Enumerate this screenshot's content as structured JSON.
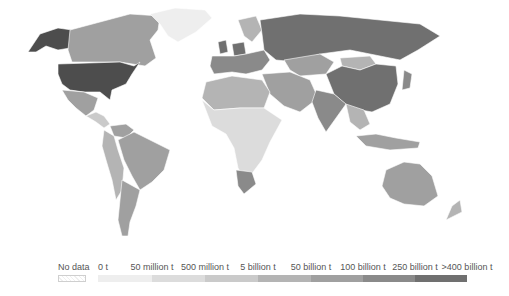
{
  "map": {
    "projection": "world-robinson-like",
    "colors": {
      "no_data": "#f4f4f4",
      "bin_0": "#eeeeee",
      "bin_1": "#dcdcdc",
      "bin_2": "#cacaca",
      "bin_3": "#b4b4b4",
      "bin_4": "#a0a0a0",
      "bin_5": "#8a8a8a",
      "bin_6": "#707070",
      "bin_7": "#4d4d4d"
    },
    "regions": [
      {
        "name": "United States",
        "bin": 7
      },
      {
        "name": "Alaska",
        "bin": 7
      },
      {
        "name": "Canada",
        "bin": 4
      },
      {
        "name": "Greenland",
        "bin": 0
      },
      {
        "name": "Mexico",
        "bin": 4
      },
      {
        "name": "Central America",
        "bin": 2
      },
      {
        "name": "Brazil",
        "bin": 4
      },
      {
        "name": "Argentina",
        "bin": 4
      },
      {
        "name": "Venezuela",
        "bin": 4
      },
      {
        "name": "Western South America",
        "bin": 3
      },
      {
        "name": "Europe West",
        "bin": 5
      },
      {
        "name": "United Kingdom",
        "bin": 6
      },
      {
        "name": "Germany",
        "bin": 6
      },
      {
        "name": "Scandinavia",
        "bin": 3
      },
      {
        "name": "Russia",
        "bin": 6
      },
      {
        "name": "Kazakhstan",
        "bin": 4
      },
      {
        "name": "China",
        "bin": 6
      },
      {
        "name": "Mongolia",
        "bin": 3
      },
      {
        "name": "India",
        "bin": 5
      },
      {
        "name": "Middle East",
        "bin": 4
      },
      {
        "name": "Japan",
        "bin": 5
      },
      {
        "name": "Southeast Asia",
        "bin": 3
      },
      {
        "name": "Indonesia",
        "bin": 4
      },
      {
        "name": "Australia",
        "bin": 4
      },
      {
        "name": "New Zealand",
        "bin": 3
      },
      {
        "name": "North Africa",
        "bin": 3
      },
      {
        "name": "Sub-Saharan Africa",
        "bin": 1
      },
      {
        "name": "South Africa",
        "bin": 5
      }
    ]
  },
  "legend": {
    "items": [
      {
        "label": "No data",
        "color": "#f4f4f4"
      },
      {
        "label": "0 t",
        "color": "#eeeeee"
      },
      {
        "label": "50 million t",
        "color": "#dcdcdc"
      },
      {
        "label": "500 million t",
        "color": "#cacaca"
      },
      {
        "label": "5 billion t",
        "color": "#b4b4b4"
      },
      {
        "label": "50 billion t",
        "color": "#a0a0a0"
      },
      {
        "label": "100 billion t",
        "color": "#8a8a8a"
      },
      {
        "label": "250 billion t",
        "color": "#707070"
      },
      {
        "label": ">400 billion t",
        "color": "#4d4d4d"
      }
    ]
  }
}
